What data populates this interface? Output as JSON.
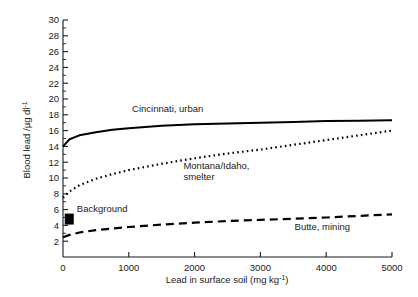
{
  "chart_data": {
    "type": "line",
    "title": "",
    "xlabel": "Lead in surface soil (mg kg",
    "xlabel_sup": "-1",
    "xlabel_tail": ")",
    "ylabel": "Blood lead /µg dl",
    "ylabel_sup": "-1",
    "xlim": [
      0,
      5000
    ],
    "ylim": [
      0,
      30
    ],
    "grid": false,
    "legend_position": "inline-annotations",
    "xticks": [
      0,
      1000,
      2000,
      3000,
      4000,
      5000
    ],
    "xtick_labels": [
      "0",
      "1000",
      "2000",
      "3000",
      "4000",
      "5000"
    ],
    "yticks": [
      2,
      4,
      6,
      8,
      10,
      12,
      14,
      16,
      18,
      20,
      22,
      24,
      26,
      28,
      30
    ],
    "ytick_labels": [
      "2",
      "4",
      "6",
      "8",
      "10",
      "12",
      "14",
      "16",
      "18",
      "20",
      "22",
      "24",
      "26",
      "28",
      "30"
    ],
    "x": [
      0,
      100,
      250,
      500,
      750,
      1000,
      1500,
      2000,
      2500,
      3000,
      3500,
      4000,
      4500,
      5000
    ],
    "series": [
      {
        "name": "Cincinnati, urban",
        "style": "solid",
        "color": "#000000",
        "values": [
          14.0,
          14.9,
          15.4,
          15.8,
          16.1,
          16.3,
          16.6,
          16.8,
          16.9,
          17.0,
          17.1,
          17.2,
          17.25,
          17.3
        ],
        "label": "Cincinnati, urban",
        "label_x": 1050,
        "label_y": 18.3
      },
      {
        "name": "Montana/Idaho, smelter",
        "style": "dotted",
        "color": "#000000",
        "values": [
          7.5,
          8.3,
          9.1,
          9.9,
          10.5,
          11.0,
          11.8,
          12.5,
          13.1,
          13.6,
          14.2,
          14.8,
          15.4,
          16.0
        ],
        "label_line1": "Montana/Idaho,",
        "label_line2": "smelter",
        "label_x": 1830,
        "label_y": 11.2
      },
      {
        "name": "Butte, mining",
        "style": "dashed",
        "color": "#000000",
        "values": [
          2.5,
          2.8,
          3.1,
          3.4,
          3.6,
          3.8,
          4.1,
          4.35,
          4.55,
          4.7,
          4.85,
          5.0,
          5.2,
          5.4
        ],
        "label": "Butte, mining",
        "label_x": 3520,
        "label_y": 3.4
      }
    ],
    "annotations": [
      {
        "name": "background-marker",
        "label": "Background",
        "marker": "filled-square",
        "color": "#000000",
        "x": 95,
        "y": 4.8,
        "label_x": 210,
        "label_y": 5.7
      }
    ]
  }
}
